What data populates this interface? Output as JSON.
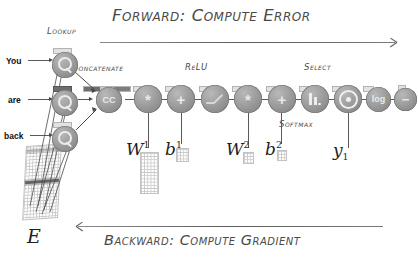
{
  "diagram": {
    "title_forward": "Forward: Compute Error",
    "title_backward": "Backward: Compute Gradient",
    "forward_arrow": "arrow-right",
    "backward_arrow": "arrow-left"
  },
  "inputs": [
    {
      "word": "You",
      "node_label": "lookup",
      "icon": "magnifier-icon"
    },
    {
      "word": "are",
      "node_label": "lookup",
      "icon": "magnifier-icon"
    },
    {
      "word": "back",
      "node_label": "lookup",
      "icon": "magnifier-icon"
    }
  ],
  "stage_labels": {
    "lookup": "Lookup",
    "concatenate": "Concatenate",
    "relu": "ReLU",
    "softmax": "Softmax",
    "select": "Select"
  },
  "nodes": [
    {
      "id": "lookup-1",
      "glyph": "magnifier-icon",
      "kind": "lookup"
    },
    {
      "id": "lookup-2",
      "glyph": "magnifier-icon",
      "kind": "lookup"
    },
    {
      "id": "lookup-3",
      "glyph": "magnifier-icon",
      "kind": "lookup"
    },
    {
      "id": "concat",
      "glyph": "CC",
      "kind": "concatenate"
    },
    {
      "id": "matmul-1",
      "glyph": "*",
      "kind": "multiply"
    },
    {
      "id": "add-1",
      "glyph": "+",
      "kind": "add"
    },
    {
      "id": "relu",
      "glyph": "relu-icon",
      "kind": "relu"
    },
    {
      "id": "matmul-2",
      "glyph": "*",
      "kind": "multiply"
    },
    {
      "id": "add-2",
      "glyph": "+",
      "kind": "add"
    },
    {
      "id": "softmax",
      "glyph": "bars-icon",
      "kind": "softmax"
    },
    {
      "id": "select",
      "glyph": "target-icon",
      "kind": "select"
    },
    {
      "id": "log",
      "glyph": "log",
      "kind": "log"
    },
    {
      "id": "negate",
      "glyph": "−",
      "kind": "negate"
    }
  ],
  "parameters": [
    {
      "id": "W1",
      "base": "W",
      "sup": "1",
      "sub": ""
    },
    {
      "id": "b1",
      "base": "b",
      "sup": "1",
      "sub": ""
    },
    {
      "id": "W2",
      "base": "W",
      "sup": "2",
      "sub": ""
    },
    {
      "id": "b2",
      "base": "b",
      "sup": "2",
      "sub": ""
    },
    {
      "id": "y1",
      "base": "y",
      "sup": "",
      "sub": "1"
    }
  ],
  "embedding": {
    "label": "E"
  },
  "colors": {
    "node_fill": "#8f8f8f",
    "node_glyph": "#e9e9e9",
    "ink": "#4a4a4a",
    "math_ink": "#1f1f1f",
    "grid_line": "#c6c6c6",
    "highlight_row": "#5f5f5f"
  }
}
